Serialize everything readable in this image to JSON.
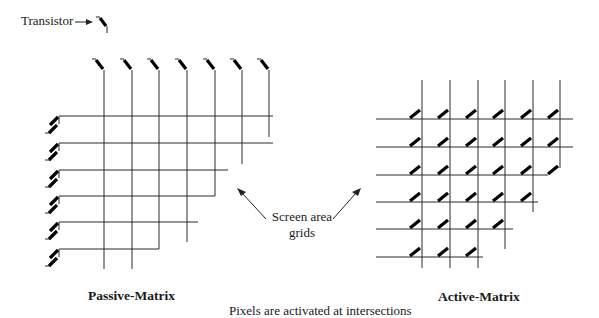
{
  "legend": {
    "transistor_label": "Transistor",
    "arrow_icon": "right-arrow-icon",
    "transistor_icon": "transistor-symbol-icon"
  },
  "center_note": {
    "line1": "Screen area",
    "line2": "grids"
  },
  "passive_matrix": {
    "label": "Passive-Matrix",
    "columns": 7,
    "rows": 6,
    "column_x": [
      104,
      132,
      159,
      187,
      215,
      242,
      269
    ],
    "row_y": [
      116,
      143,
      170,
      196,
      222,
      249
    ],
    "grid_top_y": 70,
    "row_start_x": 59
  },
  "active_matrix": {
    "label": "Active-Matrix",
    "columns": 6,
    "rows": 6,
    "column_x": [
      422,
      450,
      478,
      505,
      533,
      560
    ],
    "row_y": [
      119,
      147,
      175,
      202,
      229,
      257
    ],
    "transistors_per_row": [
      6,
      6,
      6,
      5,
      4,
      3
    ],
    "grid_top_y": 80,
    "row_start_x": 376
  },
  "caption": "Pixels are activated at intersections",
  "colors": {
    "line": "#2a2a2a",
    "transistor": "#000000",
    "background": "#ffffff"
  }
}
